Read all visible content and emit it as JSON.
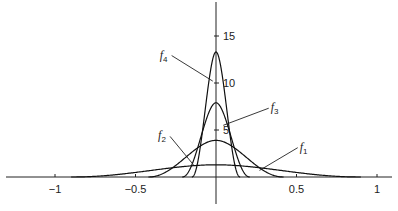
{
  "chart_data": {
    "type": "line",
    "title": "",
    "xlabel": "",
    "ylabel": "",
    "xlim": [
      -1.2,
      1.1
    ],
    "ylim": [
      -3,
      18
    ],
    "grid": false,
    "x_ticks": [
      {
        "value": -1,
        "label": "−1"
      },
      {
        "value": -0.5,
        "label": "−0.5"
      },
      {
        "value": 0.5,
        "label": "0.5"
      },
      {
        "value": 1,
        "label": "1"
      }
    ],
    "y_ticks": [
      {
        "value": 5,
        "label": "5"
      },
      {
        "value": 10,
        "label": "10"
      },
      {
        "value": 15,
        "label": "15"
      }
    ],
    "series": [
      {
        "name": "f1",
        "label_main": "f",
        "label_sub": "1",
        "peak": 1.3,
        "half_width": 0.9,
        "label_pos": [
          0.52,
          2.8
        ],
        "leader_to": [
          0.27,
          0.7
        ]
      },
      {
        "name": "f2",
        "label_main": "f",
        "label_sub": "2",
        "peak": 3.9,
        "half_width": 0.42,
        "label_pos": [
          -0.36,
          4.0
        ],
        "leader_to": [
          -0.14,
          1.3
        ]
      },
      {
        "name": "f3",
        "label_main": "f",
        "label_sub": "3",
        "peak": 7.9,
        "half_width": 0.21,
        "label_pos": [
          0.34,
          7.0
        ],
        "leader_to": [
          0.045,
          5.5
        ]
      },
      {
        "name": "f4",
        "label_main": "f",
        "label_sub": "4",
        "peak": 13.3,
        "half_width": 0.15,
        "label_pos": [
          -0.35,
          12.6
        ],
        "leader_to": [
          -0.02,
          10.2
        ]
      }
    ]
  }
}
